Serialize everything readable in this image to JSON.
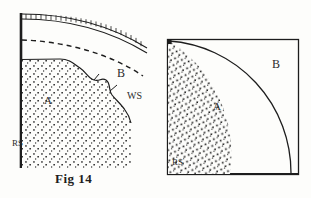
{
  "figure": {
    "caption": "Fig 14",
    "background_color": "#fdfdfb",
    "ink_color": "#1d1d1d",
    "stipple_color": "#262626",
    "panels": [
      {
        "id": "left-panel",
        "name": "curved-sector-diagram",
        "labels": {
          "region_a": "A",
          "region_b": "B",
          "boundary_ws": "WS",
          "edge_rs": "RS"
        },
        "features": [
          "thick-vertical-left-edge",
          "hatched-top-band",
          "dashed-arc",
          "irregular-stippled-boundary",
          "stippled-region-a"
        ]
      },
      {
        "id": "right-panel",
        "name": "quarter-circle-diagram",
        "labels": {
          "region_a": "A",
          "region_b": "B",
          "edge_rs": "RS"
        },
        "features": [
          "rectangular-frame",
          "quarter-circle-arc",
          "stippled-region-a"
        ]
      }
    ]
  }
}
